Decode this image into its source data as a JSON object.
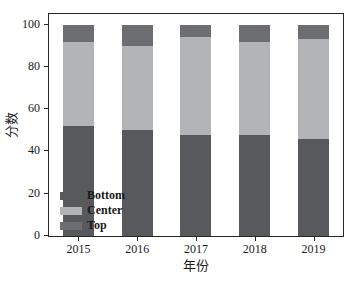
{
  "figure": {
    "background": "#ffffff",
    "axis_color": "#262626",
    "text_color": "#1a1a1a"
  },
  "chart_data": {
    "type": "bar",
    "stacked": true,
    "title": "",
    "xlabel": "年份",
    "ylabel": "分数",
    "categories": [
      "2015",
      "2016",
      "2017",
      "2018",
      "2019"
    ],
    "series": [
      {
        "name": "Bottom",
        "color": "#58595c",
        "values": [
          52,
          50,
          48,
          48,
          46
        ]
      },
      {
        "name": "Center",
        "color": "#b3b4b6",
        "values": [
          40,
          40,
          46,
          44,
          47
        ]
      },
      {
        "name": "Top",
        "color": "#6d6e71",
        "values": [
          8,
          10,
          6,
          8,
          7
        ]
      }
    ],
    "yticks": [
      0,
      20,
      40,
      60,
      80,
      100
    ],
    "ylim": [
      0,
      105
    ],
    "grid": false,
    "legend": {
      "position": "lower-left",
      "entries": [
        "Bottom",
        "Center",
        "Top"
      ]
    }
  }
}
